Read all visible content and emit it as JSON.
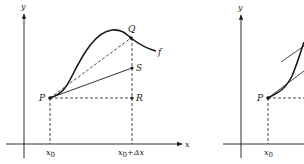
{
  "figure": {
    "colors": {
      "ink": "#1a1a1a",
      "background": "#ffffff"
    },
    "left_panel": {
      "axis_y_label": "y",
      "axis_x_label": "x",
      "points": {
        "P": {
          "label": "P"
        },
        "Q": {
          "label": "Q"
        },
        "R": {
          "label": "R"
        },
        "S": {
          "label": "S"
        }
      },
      "function_label": "f",
      "tick_x0": {
        "main": "x",
        "sub": "0"
      },
      "tick_x0_dx": {
        "main": "x",
        "sub": "0",
        "rest": "+Δx"
      }
    },
    "right_panel": {
      "axis_y_label": "y",
      "points": {
        "P": {
          "label": "P"
        }
      },
      "tick_x0": {
        "main": "x",
        "sub": "0"
      }
    }
  }
}
